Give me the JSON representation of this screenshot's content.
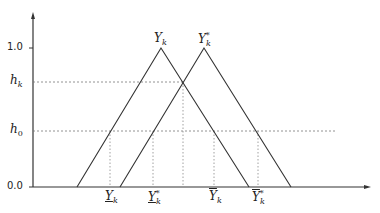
{
  "diagram": {
    "type": "fuzzy-triangular-membership",
    "y_axis": {
      "ticks": [
        {
          "label": "1.0",
          "value": 1.0
        },
        {
          "label": "0.0",
          "value": 0.0
        }
      ],
      "levels": [
        {
          "label_main": "h",
          "label_sub": "k"
        },
        {
          "label_main": "h",
          "label_sub": "0"
        }
      ]
    },
    "triangles": [
      {
        "name": "Y_k",
        "label_main": "Y",
        "label_sub": "k",
        "label_sup": ""
      },
      {
        "name": "Y*_k",
        "label_main": "Y",
        "label_sub": "k",
        "label_sup": "*"
      }
    ],
    "x_labels": [
      {
        "label_main": "Y",
        "label_sub": "k",
        "label_sup": "",
        "decoration": "underline"
      },
      {
        "label_main": "Y",
        "label_sub": "k",
        "label_sup": "*",
        "decoration": "underline"
      },
      {
        "label_main": "Y",
        "label_sub": "k",
        "label_sup": "",
        "decoration": "overline"
      },
      {
        "label_main": "Y",
        "label_sub": "k",
        "label_sup": "*",
        "decoration": "overline"
      }
    ],
    "colors": {
      "line": "#333333",
      "dotted": "#777777",
      "background": "#ffffff"
    }
  }
}
